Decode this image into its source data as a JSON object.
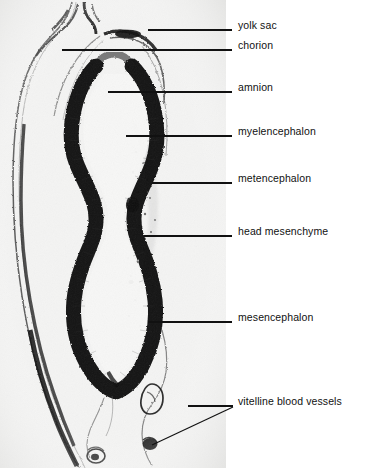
{
  "figure": {
    "kind": "histology-micrograph",
    "plate_background": "#f2f2f1",
    "page_background": "#ffffff",
    "ink_color": "#111111",
    "stain_color": "#0a0a0a"
  },
  "labels": [
    {
      "id": "yolk-sac",
      "text": "yolk sac",
      "text_y": 26,
      "line_y": 30,
      "line_x1": 148,
      "line_x2": 232
    },
    {
      "id": "chorion",
      "text": "chorion",
      "text_y": 46,
      "line_y": 50,
      "line_x1": 62,
      "line_x2": 232
    },
    {
      "id": "amnion",
      "text": "amnion",
      "text_y": 88,
      "line_y": 92,
      "line_x1": 108,
      "line_x2": 232
    },
    {
      "id": "myelencephalon",
      "text": "myelencephalon",
      "text_y": 132,
      "line_y": 136,
      "line_x1": 126,
      "line_x2": 232
    },
    {
      "id": "metencephalon",
      "text": "metencephalon",
      "text_y": 179,
      "line_y": 183,
      "line_x1": 152,
      "line_x2": 232
    },
    {
      "id": "head-mesenchyme",
      "text": "head mesenchyme",
      "text_y": 232,
      "line_y": 236,
      "line_x1": 144,
      "line_x2": 232
    },
    {
      "id": "mesencephalon",
      "text": "mesencephalon",
      "text_y": 318,
      "line_y": 322,
      "line_x1": 148,
      "line_x2": 232
    },
    {
      "id": "vitelline-blood-vessels",
      "text": "vitelline blood vessels",
      "text_y": 402,
      "line_y": 406,
      "line_x1": 188,
      "line_x2": 232
    }
  ],
  "vitelline_second_leader": {
    "id": "vitelline-lower-leader",
    "from_x": 152,
    "from_y": 445,
    "to_x": 233,
    "to_y": 407
  }
}
